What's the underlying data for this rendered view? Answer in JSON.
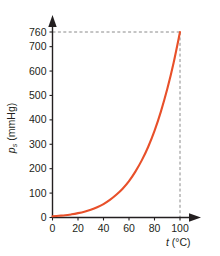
{
  "chart_data": {
    "type": "line",
    "title": "",
    "subtitle": "",
    "xlabel_symbol": "t",
    "xlabel_units": " (°C)",
    "xlabel": "t (°C)",
    "ylabel_symbol": "p",
    "ylabel_subscript": "s",
    "ylabel_units": " (mmHg)",
    "ylabel": "pₛ (mmHg)",
    "xlim": [
      0,
      110
    ],
    "ylim": [
      0,
      800
    ],
    "grid": false,
    "legend": null,
    "xticks": [
      0,
      20,
      40,
      60,
      80,
      100
    ],
    "xtick_labels": [
      "0",
      "20",
      "40",
      "60",
      "80",
      "100"
    ],
    "yticks": [
      0,
      100,
      200,
      300,
      400,
      500,
      600,
      700,
      760
    ],
    "ytick_labels": [
      "0",
      "100",
      "200",
      "300",
      "400",
      "500",
      "600",
      "700",
      "760"
    ],
    "series": [
      {
        "name": "saturated vapour pressure of water",
        "color": "#e8502a",
        "x": [
          0,
          5,
          10,
          15,
          20,
          25,
          30,
          35,
          40,
          45,
          50,
          55,
          60,
          65,
          70,
          75,
          80,
          85,
          90,
          95,
          100
        ],
        "values": [
          5,
          7,
          9,
          13,
          18,
          24,
          32,
          42,
          55,
          72,
          93,
          118,
          149,
          188,
          234,
          289,
          355,
          434,
          526,
          634,
          760
        ]
      }
    ],
    "annotations": [
      {
        "name": "pressure-guide",
        "type": "horizontal-dashed-line",
        "y": 760,
        "color": "#8a8a8a"
      },
      {
        "name": "temperature-guide",
        "type": "vertical-dashed-line",
        "x": 100,
        "color": "#8a8a8a"
      }
    ],
    "axis_color": "#231f20",
    "background": "#ffffff"
  }
}
